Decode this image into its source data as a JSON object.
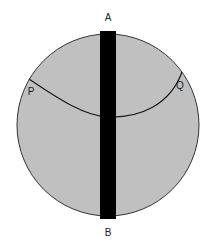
{
  "diagram": {
    "labels": {
      "top": "A",
      "bottom": "B",
      "left_point": "P",
      "right_point": "Q"
    },
    "colors": {
      "disc_fill": "#c0c0c0",
      "disc_stroke": "#333333",
      "bar_fill": "#000000",
      "curve_stroke": "#1a1a1a"
    }
  }
}
